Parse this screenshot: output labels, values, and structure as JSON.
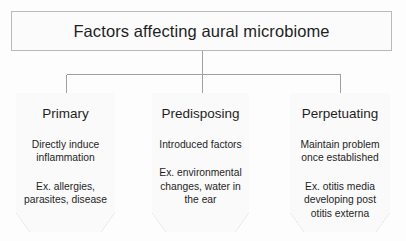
{
  "diagram": {
    "type": "hierarchy-flowchart",
    "root": {
      "title": "Factors affecting aural microbiome"
    },
    "categories": [
      {
        "heading": "Primary",
        "description": "Directly induce inflammation",
        "example": "Ex. allergies, parasites, disease"
      },
      {
        "heading": "Predisposing",
        "description": "Introduced factors",
        "example": "Ex. environmental changes, water in the ear"
      },
      {
        "heading": "Perpetuating",
        "description": "Maintain problem once established",
        "example": "Ex. otitis media developing post otitis externa"
      }
    ],
    "colors": {
      "background": "#fdfdfd",
      "box_fill": "#fafafa",
      "box_border": "#b9b9b9",
      "connector": "#a0a0a0",
      "text": "#1f1f1f"
    }
  }
}
